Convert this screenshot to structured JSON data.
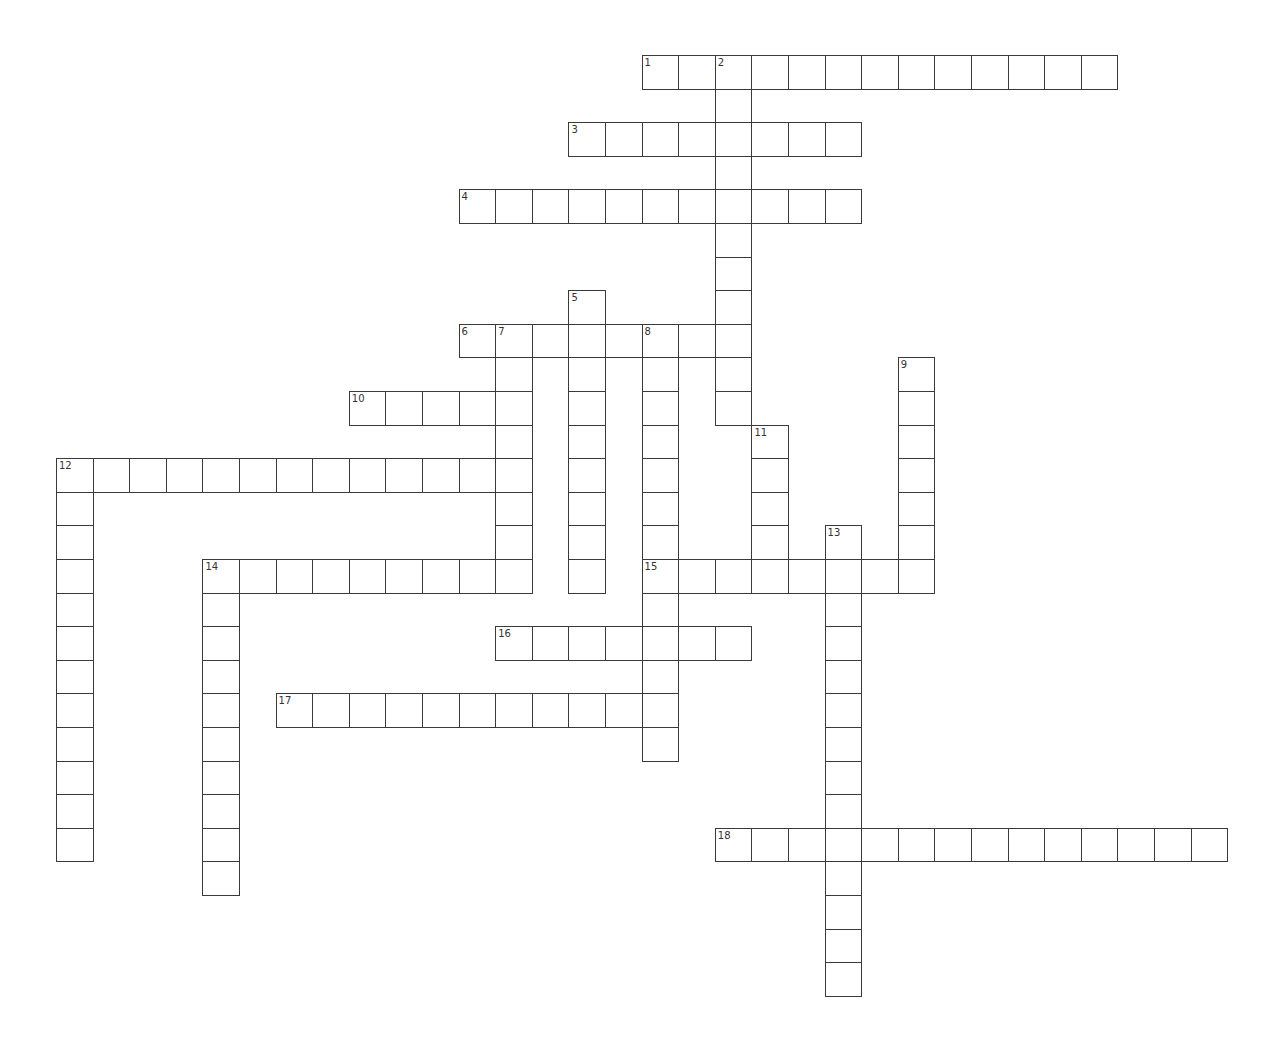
{
  "puzzle": {
    "type": "crossword",
    "colors": {
      "grid_line": "#3a3a3a",
      "cell_fill": "#ffffff",
      "number_text": "#333333",
      "background": "#ffffff"
    },
    "grid": {
      "origin_x": 56,
      "origin_y": 55,
      "cell_w": 36.6,
      "cell_h": 33.6
    },
    "across": [
      {
        "number": "1",
        "row": 0,
        "col": 16,
        "length": 13
      },
      {
        "number": "3",
        "row": 2,
        "col": 14,
        "length": 8
      },
      {
        "number": "4",
        "row": 4,
        "col": 11,
        "length": 11
      },
      {
        "number": "6",
        "row": 8,
        "col": 11,
        "length": 8
      },
      {
        "number": "10",
        "row": 10,
        "col": 8,
        "length": 5
      },
      {
        "number": "12",
        "row": 12,
        "col": 0,
        "length": 13
      },
      {
        "number": "14",
        "row": 15,
        "col": 4,
        "length": 9
      },
      {
        "number": "15",
        "row": 15,
        "col": 16,
        "length": 8
      },
      {
        "number": "16",
        "row": 17,
        "col": 12,
        "length": 7
      },
      {
        "number": "17",
        "row": 19,
        "col": 6,
        "length": 11
      },
      {
        "number": "18",
        "row": 23,
        "col": 18,
        "length": 14
      }
    ],
    "down": [
      {
        "number": "2",
        "row": 0,
        "col": 18,
        "length": 11
      },
      {
        "number": "5",
        "row": 7,
        "col": 14,
        "length": 9
      },
      {
        "number": "7",
        "row": 8,
        "col": 12,
        "length": 8
      },
      {
        "number": "8",
        "row": 8,
        "col": 16,
        "length": 13
      },
      {
        "number": "9",
        "row": 9,
        "col": 23,
        "length": 7
      },
      {
        "number": "11",
        "row": 11,
        "col": 19,
        "length": 5
      },
      {
        "number": "12",
        "row": 12,
        "col": 0,
        "length": 12
      },
      {
        "number": "13",
        "row": 14,
        "col": 21,
        "length": 14
      },
      {
        "number": "14",
        "row": 15,
        "col": 4,
        "length": 10
      }
    ]
  }
}
